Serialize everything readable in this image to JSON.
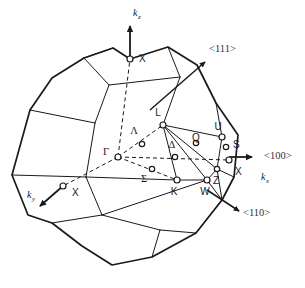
{
  "figure": {
    "name": "fcc-brillouin-zone",
    "background_color": "#ffffff",
    "edge_color": "#1a1a1a",
    "label_color": "#1a1a1a",
    "direction_label_color": "#333333"
  },
  "axes": [
    {
      "id": "kz",
      "label": "k",
      "subscript": "z",
      "label_x": 133,
      "label_y": 14,
      "sub_dx": 7,
      "sub_dy": 3,
      "from": [
        130,
        59
      ],
      "to": [
        130,
        22
      ],
      "arrow": "up"
    },
    {
      "id": "kx",
      "label": "k",
      "subscript": "x",
      "label_x": 264,
      "label_y": 178,
      "sub_dx": 7,
      "sub_dy": 3,
      "from": [
        118,
        157
      ],
      "to": [
        258,
        157
      ],
      "arrow": "right"
    },
    {
      "id": "ky",
      "label": "k",
      "subscript": "y",
      "label_x": 30,
      "label_y": 196,
      "sub_dx": 7,
      "sub_dy": 3,
      "from": [
        118,
        157
      ],
      "to": [
        38,
        208
      ],
      "arrow": "down-left"
    }
  ],
  "directions": [
    {
      "id": "dir-111",
      "label": "<111>",
      "label_x": 212,
      "label_y": 50,
      "arrow_from": [
        150,
        110
      ],
      "arrow_to": [
        209,
        59
      ]
    },
    {
      "id": "dir-100",
      "label": "<100>",
      "label_x": 266,
      "label_y": 157,
      "arrow_from": [
        230,
        157
      ],
      "arrow_to": [
        258,
        157
      ]
    },
    {
      "id": "dir-110",
      "label": "<110>",
      "label_x": 245,
      "label_y": 214,
      "arrow_from": [
        222,
        200
      ],
      "arrow_to": [
        243,
        213
      ]
    }
  ],
  "symmetry_points": [
    {
      "id": "pt-gamma",
      "label": "Γ",
      "x": 118,
      "y": 157,
      "label_x": 109,
      "label_y": 153,
      "style": "greek",
      "marker": true
    },
    {
      "id": "pt-x-top",
      "label": "X",
      "x": 130,
      "y": 59,
      "label_x": 139,
      "label_y": 59,
      "style": "latin",
      "marker": true
    },
    {
      "id": "pt-x-left",
      "label": "X",
      "x": 63,
      "y": 186,
      "label_x": 72,
      "label_y": 193,
      "style": "latin",
      "marker": true
    },
    {
      "id": "pt-x-right",
      "label": "X",
      "x": 229,
      "y": 160,
      "label_x": 235,
      "label_y": 172,
      "style": "latin",
      "marker": true
    },
    {
      "id": "pt-l",
      "label": "L",
      "x": 163,
      "y": 125,
      "label_x": 158,
      "label_y": 113,
      "style": "latin",
      "marker": true
    },
    {
      "id": "pt-lambda",
      "label": "Λ",
      "x": 142,
      "y": 144,
      "label_x": 134,
      "label_y": 132,
      "style": "greek",
      "marker": true
    },
    {
      "id": "pt-delta",
      "label": "Δ",
      "x": 175,
      "y": 157,
      "label_x": 172,
      "label_y": 146,
      "style": "greek",
      "marker": true
    },
    {
      "id": "pt-sigma",
      "label": "Σ",
      "x": 152,
      "y": 169,
      "label_x": 144,
      "label_y": 180,
      "style": "greek",
      "marker": true
    },
    {
      "id": "pt-k",
      "label": "K",
      "x": 177,
      "y": 180,
      "label_x": 174,
      "label_y": 192,
      "style": "latin",
      "marker": true
    },
    {
      "id": "pt-w",
      "label": "W",
      "x": 207,
      "y": 180,
      "label_x": 203,
      "label_y": 192,
      "style": "latin",
      "marker": true
    },
    {
      "id": "pt-q",
      "label": "Q",
      "x": 196,
      "y": 143,
      "label_x": 192,
      "label_y": 146,
      "style": "latin",
      "marker": true
    },
    {
      "id": "pt-u",
      "label": "U",
      "x": 222,
      "y": 137,
      "label_x": 216,
      "label_y": 126,
      "style": "latin",
      "marker": true
    },
    {
      "id": "pt-s",
      "label": "S",
      "x": 226,
      "y": 147,
      "label_x": 232,
      "label_y": 147,
      "style": "latin",
      "marker": true
    },
    {
      "id": "pt-z",
      "label": "Z",
      "x": 217,
      "y": 169,
      "label_x": 219,
      "label_y": 180,
      "style": "latin",
      "marker": true
    }
  ],
  "zone_outline": [
    [
      130,
      59
    ],
    [
      168,
      47
    ],
    [
      197,
      65
    ],
    [
      216,
      103
    ],
    [
      238,
      135
    ],
    [
      234,
      177
    ],
    [
      222,
      200
    ],
    [
      196,
      233
    ],
    [
      152,
      257
    ],
    [
      112,
      265
    ],
    [
      82,
      246
    ],
    [
      52,
      223
    ],
    [
      28,
      215
    ],
    [
      12,
      175
    ],
    [
      30,
      110
    ],
    [
      52,
      78
    ],
    [
      84,
      58
    ],
    [
      113,
      48
    ]
  ],
  "inner_edges": [
    {
      "id": "edge-top-front-left",
      "pts": [
        [
          84,
          58
        ],
        [
          109,
          85
        ]
      ]
    },
    {
      "id": "edge-top-front-right",
      "pts": [
        [
          168,
          47
        ],
        [
          180,
          77
        ]
      ]
    },
    {
      "id": "edge-top-square-a",
      "pts": [
        [
          84,
          58
        ],
        [
          113,
          48
        ]
      ]
    },
    {
      "id": "edge-top-square-b",
      "pts": [
        [
          109,
          85
        ],
        [
          180,
          77
        ]
      ]
    },
    {
      "id": "edge-face-left-1",
      "pts": [
        [
          30,
          110
        ],
        [
          95,
          123
        ]
      ]
    },
    {
      "id": "edge-face-left-2",
      "pts": [
        [
          95,
          123
        ],
        [
          109,
          85
        ]
      ]
    },
    {
      "id": "edge-face-left-3",
      "pts": [
        [
          95,
          123
        ],
        [
          86,
          177
        ]
      ]
    },
    {
      "id": "edge-face-left-4",
      "pts": [
        [
          12,
          175
        ],
        [
          86,
          177
        ]
      ]
    },
    {
      "id": "edge-face-left-5",
      "pts": [
        [
          86,
          177
        ],
        [
          102,
          215
        ]
      ]
    },
    {
      "id": "edge-face-left-6",
      "pts": [
        [
          52,
          223
        ],
        [
          102,
          215
        ]
      ]
    },
    {
      "id": "edge-face-bot-1",
      "pts": [
        [
          102,
          215
        ],
        [
          160,
          230
        ]
      ]
    },
    {
      "id": "edge-face-bot-2",
      "pts": [
        [
          160,
          230
        ],
        [
          196,
          233
        ]
      ]
    },
    {
      "id": "edge-face-bot-3",
      "pts": [
        [
          160,
          230
        ],
        [
          152,
          257
        ]
      ]
    },
    {
      "id": "edge-hex-right-1",
      "pts": [
        [
          180,
          77
        ],
        [
          163,
          125
        ]
      ]
    },
    {
      "id": "edge-hex-right-2",
      "pts": [
        [
          216,
          103
        ],
        [
          222,
          137
        ]
      ]
    },
    {
      "id": "edge-hex-right-3",
      "pts": [
        [
          163,
          125
        ],
        [
          222,
          137
        ]
      ]
    },
    {
      "id": "edge-hex-right-4",
      "pts": [
        [
          222,
          137
        ],
        [
          217,
          169
        ]
      ]
    },
    {
      "id": "edge-hex-right-5",
      "pts": [
        [
          217,
          169
        ],
        [
          222,
          200
        ]
      ]
    },
    {
      "id": "edge-sq-right-1",
      "pts": [
        [
          234,
          177
        ],
        [
          217,
          169
        ]
      ]
    },
    {
      "id": "edge-kw-1",
      "pts": [
        [
          163,
          125
        ],
        [
          177,
          180
        ]
      ]
    },
    {
      "id": "edge-kw-2",
      "pts": [
        [
          163,
          125
        ],
        [
          207,
          180
        ]
      ]
    },
    {
      "id": "edge-kw-3",
      "pts": [
        [
          163,
          125
        ],
        [
          217,
          169
        ]
      ]
    },
    {
      "id": "edge-kw-4",
      "pts": [
        [
          177,
          180
        ],
        [
          207,
          180
        ]
      ]
    },
    {
      "id": "edge-kw-5",
      "pts": [
        [
          207,
          180
        ],
        [
          217,
          169
        ]
      ]
    },
    {
      "id": "edge-kw-6",
      "pts": [
        [
          86,
          177
        ],
        [
          177,
          180
        ]
      ]
    },
    {
      "id": "edge-kw-7",
      "pts": [
        [
          102,
          215
        ],
        [
          207,
          180
        ]
      ]
    },
    {
      "id": "edge-kw-8",
      "pts": [
        [
          196,
          233
        ],
        [
          222,
          200
        ]
      ]
    },
    {
      "id": "edge-kw-9",
      "pts": [
        [
          207,
          180
        ],
        [
          222,
          200
        ]
      ]
    }
  ],
  "dashed_edges": [
    {
      "id": "dash-gamma-xtop",
      "pts": [
        [
          118,
          157
        ],
        [
          130,
          59
        ]
      ]
    },
    {
      "id": "dash-gamma-l",
      "pts": [
        [
          118,
          157
        ],
        [
          163,
          125
        ]
      ]
    },
    {
      "id": "dash-gamma-k",
      "pts": [
        [
          118,
          157
        ],
        [
          177,
          180
        ]
      ]
    },
    {
      "id": "dash-gamma-xleft",
      "pts": [
        [
          118,
          157
        ],
        [
          63,
          186
        ]
      ]
    },
    {
      "id": "dash-gamma-kx",
      "pts": [
        [
          118,
          157
        ],
        [
          229,
          160
        ]
      ]
    }
  ]
}
